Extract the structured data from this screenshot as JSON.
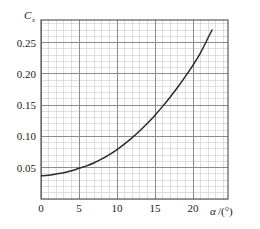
{
  "chart_data": {
    "type": "line",
    "title": "",
    "subtitle": "",
    "xlabel": "α/(°)",
    "xlabel_symbol": "α",
    "xlabel_unit": "/(°)",
    "ylabel": "C",
    "ylabel_symbol": "C",
    "ylabel_subscript": "x",
    "xlim": [
      0,
      24.6
    ],
    "ylim": [
      0.0,
      0.286
    ],
    "grid": true,
    "minor_grid": true,
    "legend": "none",
    "line_color": "#2b2b2b",
    "grid_color": "#8c8c8c",
    "minor_grid_color": "#c9c9c9",
    "axis_color": "#4d4d4d",
    "xticks": [
      0,
      5,
      10,
      15,
      20
    ],
    "xtick_labels": [
      "0",
      "5",
      "10",
      "15",
      "20"
    ],
    "xtick_minor_step": 1,
    "yticks": [
      0.05,
      0.1,
      0.15,
      0.2,
      0.25
    ],
    "ytick_labels": [
      "0.05",
      "0.10",
      "0.15",
      "0.20",
      "0.25"
    ],
    "ytick_minor_step": 0.01,
    "series": [
      {
        "name": "Cx vs alpha",
        "x": [
          0,
          1,
          2,
          3,
          4,
          5,
          6,
          7,
          8,
          9,
          10,
          11,
          12,
          13,
          14,
          15,
          16,
          17,
          18,
          19,
          20,
          21,
          22,
          22.5
        ],
        "values": [
          0.037,
          0.038,
          0.04,
          0.042,
          0.045,
          0.049,
          0.053,
          0.058,
          0.064,
          0.071,
          0.079,
          0.088,
          0.098,
          0.109,
          0.121,
          0.134,
          0.148,
          0.163,
          0.179,
          0.196,
          0.214,
          0.234,
          0.258,
          0.27
        ]
      }
    ]
  },
  "axes": {
    "y_axis_label_name": "coefficient-c-x",
    "x_axis_label_name": "angle-of-attack-degrees"
  }
}
